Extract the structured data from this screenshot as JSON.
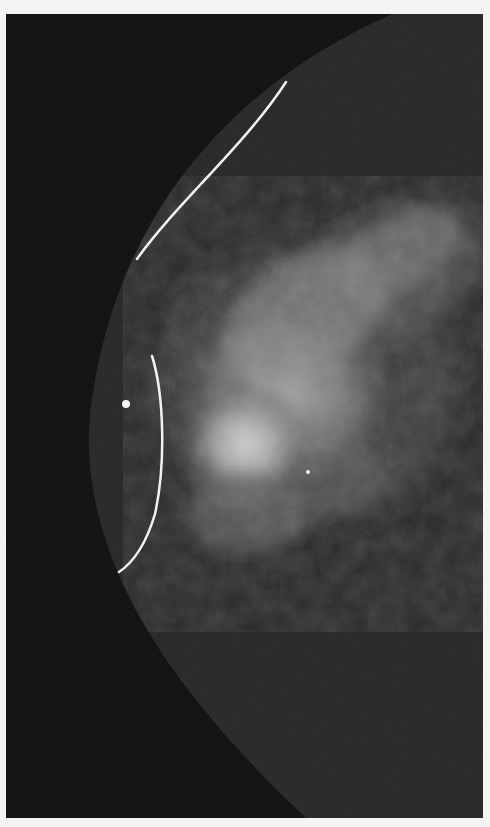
{
  "image": {
    "kind": "mammogram",
    "background_color": "#0f0f0f",
    "breast_tissue_color": "#262626",
    "frame_color": "#f4f4f4",
    "markers": [
      {
        "type": "skin-marker-line",
        "label": "upper wire marker"
      },
      {
        "type": "skin-marker-line",
        "label": "curved wire marker"
      },
      {
        "type": "dot-marker",
        "label": "nipple/bb marker"
      },
      {
        "type": "dot-marker",
        "label": "small calcification"
      }
    ]
  }
}
